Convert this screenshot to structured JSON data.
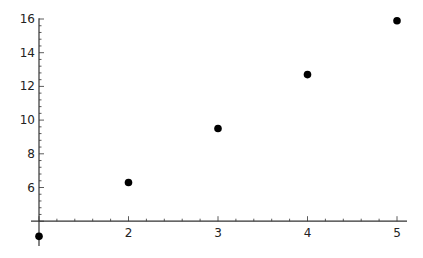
{
  "chart_data": {
    "type": "scatter",
    "title": "",
    "xlabel": "",
    "ylabel": "",
    "x": [
      1,
      2,
      3,
      4,
      5
    ],
    "series": [
      {
        "name": "points",
        "values": [
          3.1,
          6.3,
          9.5,
          12.7,
          15.9
        ]
      }
    ],
    "xticks": [
      2,
      3,
      4,
      5
    ],
    "yticks": [
      6,
      8,
      10,
      12,
      14,
      16
    ],
    "xlim": [
      1,
      5.1
    ],
    "ylim": [
      3,
      16
    ],
    "axes_origin": {
      "x": 1,
      "y": 4
    },
    "grid": false,
    "legend": null,
    "marker_color": "#000000"
  }
}
